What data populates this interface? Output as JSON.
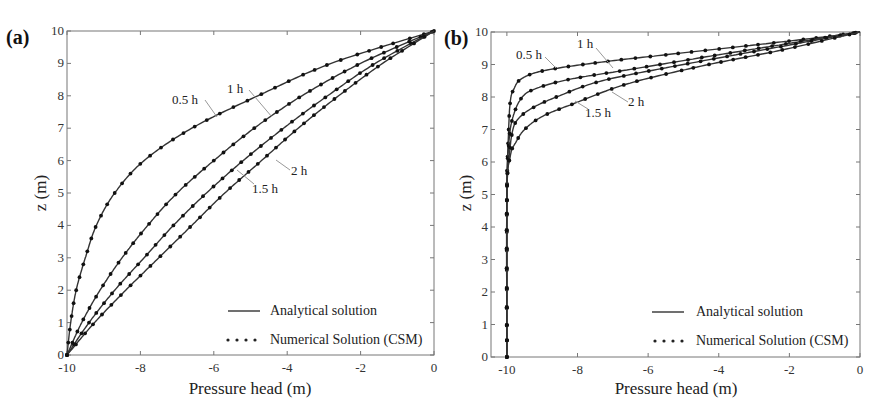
{
  "chart_data": [
    {
      "type": "line",
      "panel_label": "(a)",
      "xlabel": "Pressure head (m)",
      "ylabel": "z (m)",
      "xlim": [
        -10,
        0
      ],
      "ylim": [
        0,
        10
      ],
      "xticks": [
        "-10",
        "-8",
        "-6",
        "-4",
        "-2",
        "0"
      ],
      "yticks": [
        "0",
        "1",
        "2",
        "3",
        "4",
        "5",
        "6",
        "7",
        "8",
        "9",
        "10"
      ],
      "grid": false,
      "legend": {
        "position": "lower right",
        "entries": [
          "Analytical solution",
          "Numerical Solution (CSM)"
        ]
      },
      "series": [
        {
          "name": "0.5 h",
          "x": [
            -10,
            -9.9,
            -9.75,
            -9.5,
            -9.2,
            -8.7,
            -7.9,
            -6.6,
            -4.8,
            -2.8,
            0
          ],
          "y": [
            0,
            1,
            2,
            3,
            4,
            5,
            6,
            7,
            8,
            9,
            10
          ]
        },
        {
          "name": "1 h",
          "x": [
            -10,
            -9.6,
            -9.1,
            -8.5,
            -7.8,
            -7.0,
            -6.0,
            -4.9,
            -3.6,
            -2.0,
            0
          ],
          "y": [
            0,
            1,
            2,
            3,
            4,
            5,
            6,
            7,
            8,
            9,
            10
          ]
        },
        {
          "name": "1.5 h",
          "x": [
            -10,
            -9.4,
            -8.7,
            -7.9,
            -7.1,
            -6.2,
            -5.2,
            -4.1,
            -2.9,
            -1.6,
            0
          ],
          "y": [
            0,
            1,
            2,
            3,
            4,
            5,
            6,
            7,
            8,
            9,
            10
          ]
        },
        {
          "name": "2 h",
          "x": [
            -10,
            -9.25,
            -8.4,
            -7.5,
            -6.6,
            -5.7,
            -4.7,
            -3.7,
            -2.6,
            -1.4,
            0
          ],
          "y": [
            0,
            1,
            2,
            3,
            4,
            5,
            6,
            7,
            8,
            9,
            10
          ]
        }
      ],
      "annotations": [
        "0.5 h",
        "1 h",
        "1.5 h",
        "2 h"
      ]
    },
    {
      "type": "line",
      "panel_label": "(b)",
      "xlabel": "Pressure head (m)",
      "ylabel": "z (m)",
      "xlim": [
        -10.5,
        0
      ],
      "ylim": [
        0,
        10
      ],
      "xticks": [
        "-10",
        "-8",
        "-6",
        "-4",
        "-2",
        "0"
      ],
      "yticks": [
        "0",
        "1",
        "2",
        "3",
        "4",
        "5",
        "6",
        "7",
        "8",
        "9",
        "10"
      ],
      "grid": false,
      "legend": {
        "position": "lower right",
        "entries": [
          "Analytical solution",
          "Numerical Solution (CSM)"
        ]
      },
      "series": [
        {
          "name": "0.5 h",
          "x": [
            -10,
            -10,
            -9.95,
            -9.9,
            -9.8,
            -9.6,
            -9.0,
            -7.5,
            -5.5,
            -3.0,
            -1.0,
            0
          ],
          "y": [
            0,
            5,
            7,
            7.9,
            8.25,
            8.55,
            8.8,
            9.05,
            9.3,
            9.6,
            9.85,
            10
          ]
        },
        {
          "name": "1 h",
          "x": [
            -10,
            -10,
            -9.95,
            -9.85,
            -9.6,
            -9.2,
            -8.2,
            -6.5,
            -4.0,
            -2.0,
            0
          ],
          "y": [
            0,
            5,
            6.5,
            7.3,
            7.95,
            8.25,
            8.55,
            8.85,
            9.3,
            9.65,
            10
          ]
        },
        {
          "name": "1.5 h",
          "x": [
            -10,
            -10,
            -9.95,
            -9.85,
            -9.7,
            -9.3,
            -8.6,
            -7.3,
            -5.0,
            -2.5,
            0
          ],
          "y": [
            0,
            5,
            6.0,
            6.9,
            7.3,
            7.65,
            8.0,
            8.5,
            9.0,
            9.5,
            10
          ]
        },
        {
          "name": "2 h",
          "x": [
            -10,
            -10,
            -9.9,
            -9.75,
            -9.5,
            -9.0,
            -8.1,
            -6.6,
            -4.5,
            -2.2,
            0
          ],
          "y": [
            0,
            5,
            6.2,
            6.6,
            7.0,
            7.4,
            7.8,
            8.4,
            8.95,
            9.45,
            10
          ]
        }
      ],
      "annotations": [
        "0.5 h",
        "1 h",
        "1.5 h",
        "2 h"
      ]
    }
  ],
  "panels": [
    {
      "label": "(a)",
      "xlabel": "Pressure head (m)",
      "ylabel": "z (m)",
      "legend_line": "Analytical solution",
      "legend_dots": "Numerical Solution (CSM)"
    },
    {
      "label": "(b)",
      "xlabel": "Pressure head (m)",
      "ylabel": "z (m)",
      "legend_line": "Analytical solution",
      "legend_dots": "Numerical Solution (CSM)"
    }
  ],
  "annotation_labels": {
    "h05": "0.5 h",
    "h1": "1 h",
    "h15": "1.5 h",
    "h2": "2 h"
  }
}
